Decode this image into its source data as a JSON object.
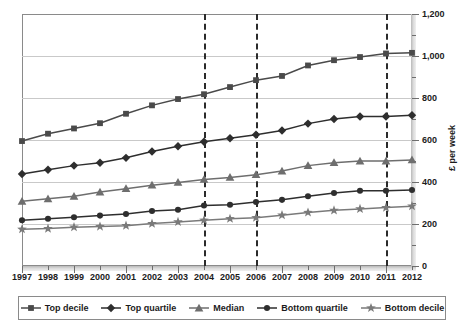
{
  "chart_data": {
    "type": "line",
    "title": "",
    "subtitle": "",
    "xlabel": "",
    "ylabel": "£ per week",
    "x": [
      1997,
      1998,
      1999,
      2000,
      2001,
      2002,
      2003,
      2004,
      2005,
      2006,
      2007,
      2008,
      2009,
      2010,
      2011,
      2012
    ],
    "categories": [
      "1997",
      "1998",
      "1999",
      "2000",
      "2001",
      "2002",
      "2003",
      "2004",
      "2005",
      "2006",
      "2007",
      "2008",
      "2009",
      "2010",
      "2011",
      "2012"
    ],
    "ylim": [
      0,
      1200
    ],
    "yticks": [
      0,
      200,
      400,
      600,
      800,
      1000,
      1200
    ],
    "yticklabels": [
      "0",
      "200",
      "400",
      "600",
      "800",
      "1,000",
      "1,200"
    ],
    "yminor_step": 100,
    "grid": true,
    "grid_axis": "y",
    "legend_position": "bottom",
    "annotations": [
      {
        "type": "vline",
        "x": 2004,
        "style": "dashed"
      },
      {
        "type": "vline",
        "x": 2006,
        "style": "dashed"
      },
      {
        "type": "vline",
        "x": 2011,
        "style": "dashed"
      }
    ],
    "series": [
      {
        "name": "Top decile",
        "marker": "square",
        "color": "#4a4a4a",
        "values": [
          595,
          630,
          655,
          680,
          725,
          765,
          795,
          818,
          852,
          885,
          905,
          955,
          980,
          995,
          1012,
          1015
        ]
      },
      {
        "name": "Top quartile",
        "marker": "diamond",
        "color": "#2e2e2e",
        "values": [
          438,
          458,
          478,
          492,
          515,
          545,
          570,
          592,
          608,
          625,
          645,
          678,
          700,
          712,
          712,
          718
        ]
      },
      {
        "name": "Median",
        "marker": "triangle",
        "color": "#6e6e6e",
        "values": [
          308,
          320,
          332,
          352,
          368,
          385,
          398,
          412,
          422,
          435,
          452,
          478,
          492,
          500,
          500,
          505
        ]
      },
      {
        "name": "Bottom quartile",
        "marker": "circle",
        "color": "#2e2e2e",
        "values": [
          218,
          225,
          232,
          240,
          248,
          262,
          268,
          288,
          292,
          305,
          315,
          332,
          348,
          358,
          358,
          362
        ]
      },
      {
        "name": "Bottom decile",
        "marker": "star",
        "color": "#7a7a7a",
        "values": [
          175,
          178,
          185,
          188,
          192,
          202,
          210,
          218,
          225,
          230,
          242,
          255,
          265,
          272,
          278,
          285
        ]
      }
    ]
  }
}
